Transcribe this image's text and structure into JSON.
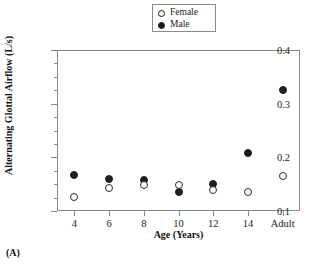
{
  "chart_data": {
    "type": "scatter",
    "title": "",
    "xlabel": "Age  (Years)",
    "ylabel": "Alternating Glottal Airflow (L/s)",
    "categories": [
      "4",
      "6",
      "8",
      "10",
      "12",
      "14",
      "Adult"
    ],
    "ylim": [
      0.1,
      0.4
    ],
    "yticks": [
      "0.1",
      "0.2",
      "0.3",
      "0.4"
    ],
    "ytick_values": [
      0.1,
      0.2,
      0.3,
      0.4
    ],
    "yminor_values": [
      0.125,
      0.15,
      0.175,
      0.225,
      0.25,
      0.275,
      0.325,
      0.35,
      0.375
    ],
    "grid": false,
    "legend_position": "top-center",
    "series": [
      {
        "name": "Female",
        "marker": "open-circle",
        "color": "#ffffff",
        "edge_color": "#2a2a2a",
        "values": [
          0.127,
          0.143,
          0.149,
          0.149,
          0.14,
          0.136,
          0.165
        ]
      },
      {
        "name": "Male",
        "marker": "filled-circle",
        "color": "#1f1f1f",
        "edge_color": "#1f1f1f",
        "values": [
          0.167,
          0.16,
          0.158,
          0.136,
          0.15,
          0.209,
          0.325
        ]
      }
    ]
  },
  "legend": {
    "entries": [
      {
        "label": "Female",
        "marker": "open"
      },
      {
        "label": "Male",
        "marker": "filled"
      }
    ]
  },
  "caption": {
    "panel_label": "(A)"
  },
  "colors": {
    "axis": "#8a8a8a",
    "text": "#1a1a1a",
    "marker_fill": "#1f1f1f",
    "marker_edge": "#2a2a2a",
    "background": "#ffffff"
  }
}
